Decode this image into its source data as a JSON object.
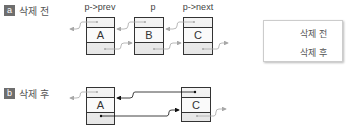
{
  "sections": [
    {
      "badge": "a",
      "title": "삭제 전",
      "pointer_labels": [
        "p->prev",
        "p",
        "p->next"
      ],
      "nodes": [
        "A",
        "B",
        "C"
      ]
    },
    {
      "badge": "b",
      "title": "삭제 후",
      "nodes": [
        "A",
        "C"
      ]
    }
  ],
  "legend": {
    "items": [
      {
        "label": "삭제 전",
        "color": "#a0a0a0"
      },
      {
        "label": "삭제 후",
        "color": "#111111"
      }
    ]
  },
  "colors": {
    "before_arrow": "#a0a0a0",
    "after_arrow": "#111111",
    "node_border": "#333333",
    "badge_bg": "#6e6e6e"
  }
}
